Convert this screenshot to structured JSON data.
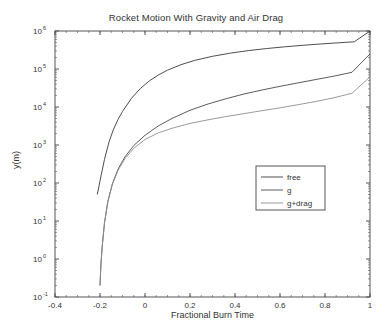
{
  "chart_data": {
    "type": "line",
    "title": "Rocket Motion With Gravity and Air Drag",
    "xlabel": "Fractional Burn Time",
    "ylabel": "y(m)",
    "xlim": [
      -0.4,
      1.0
    ],
    "ylim": [
      0.1,
      1000000
    ],
    "yscale": "log",
    "xscale": "linear",
    "grid": false,
    "legend_position": "lower right",
    "xticks": [
      -0.4,
      -0.2,
      0,
      0.2,
      0.4,
      0.6,
      0.8,
      1
    ],
    "xticklabels": [
      "-0.4",
      "-0.2",
      "0",
      "0.2",
      "0.4",
      "0.6",
      "0.8",
      "1"
    ],
    "yticks": [
      0.1,
      1,
      10,
      100,
      1000,
      10000,
      100000,
      1000000
    ],
    "yticklabels": [
      "10-1",
      "100",
      "101",
      "102",
      "103",
      "104",
      "105",
      "106"
    ],
    "ytick_mantissa": "10",
    "ytick_exponents": [
      "-1",
      "0",
      "1",
      "2",
      "3",
      "4",
      "5",
      "6"
    ],
    "series": [
      {
        "name": "free",
        "color": "#3a3a3a",
        "x": [
          -0.212,
          -0.205,
          -0.195,
          -0.18,
          -0.16,
          -0.14,
          -0.12,
          -0.1,
          -0.06,
          -0.02,
          0.02,
          0.06,
          0.1,
          0.16,
          0.22,
          0.3,
          0.38,
          0.46,
          0.54,
          0.62,
          0.7,
          0.78,
          0.86,
          0.93,
          1.0
        ],
        "y": [
          50,
          80,
          160,
          420,
          1200,
          2600,
          4700,
          7600,
          17000,
          31000,
          49000,
          70000,
          93000,
          130000,
          168000,
          216000,
          262000,
          305000,
          345000,
          383000,
          420000,
          455000,
          490000,
          520000,
          1000000
        ]
      },
      {
        "name": "g",
        "color": "#4a4a4a",
        "x": [
          -0.2,
          -0.196,
          -0.19,
          -0.18,
          -0.165,
          -0.145,
          -0.12,
          -0.09,
          -0.05,
          0.0,
          0.06,
          0.12,
          0.2,
          0.28,
          0.36,
          0.44,
          0.52,
          0.6,
          0.68,
          0.76,
          0.84,
          0.92,
          1.0
        ],
        "y": [
          0.2,
          0.7,
          2.2,
          9.0,
          33,
          95,
          230,
          480,
          970,
          1800,
          3200,
          5000,
          8200,
          12000,
          16500,
          22000,
          28000,
          35000,
          43000,
          53000,
          65000,
          82000,
          250000
        ]
      },
      {
        "name": "g+drag",
        "color": "#8f8f8f",
        "x": [
          -0.2,
          -0.196,
          -0.19,
          -0.18,
          -0.165,
          -0.145,
          -0.12,
          -0.09,
          -0.05,
          0.0,
          0.06,
          0.12,
          0.2,
          0.28,
          0.36,
          0.44,
          0.52,
          0.6,
          0.68,
          0.76,
          0.84,
          0.92,
          1.0
        ],
        "y": [
          0.2,
          0.7,
          2.2,
          9.0,
          33,
          92,
          215,
          430,
          820,
          1400,
          2100,
          2750,
          3700,
          4600,
          5600,
          6700,
          8000,
          9500,
          11500,
          14000,
          17500,
          23000,
          62000
        ]
      }
    ]
  },
  "legend": {
    "items": [
      {
        "label": "free"
      },
      {
        "label": "g"
      },
      {
        "label": "g+drag"
      }
    ]
  },
  "axes": {
    "background": "#ffffff",
    "frame_color": "#555555"
  }
}
